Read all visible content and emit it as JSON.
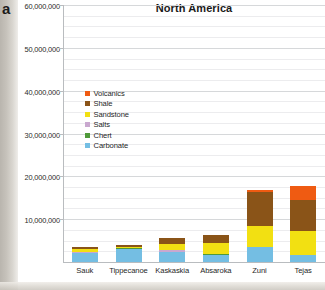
{
  "panel": {
    "letter": "a"
  },
  "chart_data": {
    "type": "bar",
    "stacked": true,
    "title": "North America",
    "xlabel": "",
    "ylabel": "",
    "ylim": [
      0,
      60000000
    ],
    "ytick_step": 10000000,
    "minor_gridline_step": 2500000,
    "grid": true,
    "legend_position": "inside upper-left",
    "categories": [
      "Sauk",
      "Tippecanoe",
      "Kaskaskia",
      "Absaroka",
      "Zuni",
      "Tejas"
    ],
    "ytick_labels": [
      "60,000,000",
      "50,000,000",
      "40,000,000",
      "30,000,000",
      "20,000,000",
      "10,000,000"
    ],
    "ytick_values": [
      60000000,
      50000000,
      40000000,
      30000000,
      20000000,
      10000000
    ],
    "series": [
      {
        "name": "Carbonate",
        "color": "#74bee3",
        "values": [
          2100000,
          3100000,
          2300000,
          1700000,
          3400000,
          1600000
        ]
      },
      {
        "name": "Chert",
        "color": "#4f9a3a",
        "values": [
          80000,
          70000,
          150000,
          90000,
          110000,
          60000
        ]
      },
      {
        "name": "Salts",
        "color": "#c9a8cf",
        "values": [
          60000,
          50000,
          300000,
          120000,
          90000,
          50000
        ]
      },
      {
        "name": "Sandstone",
        "color": "#f2e012",
        "values": [
          700000,
          300000,
          1500000,
          2600000,
          4800000,
          5500000
        ]
      },
      {
        "name": "Shale",
        "color": "#8a5418",
        "values": [
          600000,
          500000,
          1400000,
          1900000,
          8000000,
          7200000
        ]
      },
      {
        "name": "Volcanics",
        "color": "#ef5b12",
        "values": [
          0,
          0,
          0,
          0,
          400000,
          3400000
        ]
      }
    ],
    "legend_entries": [
      {
        "label": "Volcanics",
        "color": "#ef5b12"
      },
      {
        "label": "Shale",
        "color": "#8a5418"
      },
      {
        "label": "Sandstone",
        "color": "#f2e012"
      },
      {
        "label": "Salts",
        "color": "#c9a8cf"
      },
      {
        "label": "Chert",
        "color": "#4f9a3a"
      },
      {
        "label": "Carbonate",
        "color": "#74bee3"
      }
    ],
    "totals": [
      3540000,
      4020000,
      5650000,
      6410000,
      16800000,
      17810000
    ]
  }
}
